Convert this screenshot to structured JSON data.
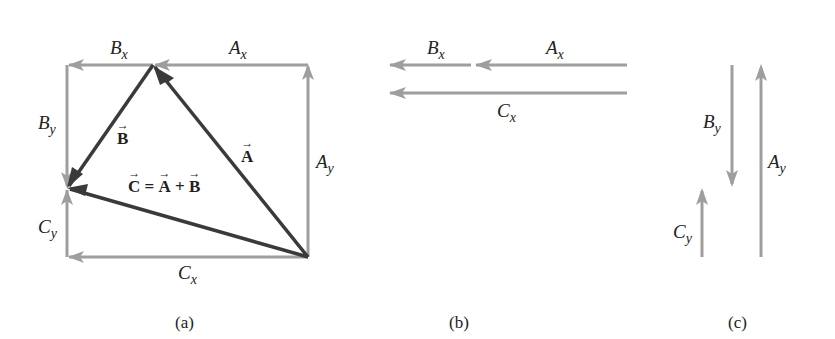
{
  "figure": {
    "colors": {
      "component": "#9e9e9e",
      "vector": "#3a3a3a",
      "text": "#222222"
    },
    "panels": {
      "a": {
        "caption": "(a)",
        "labels": {
          "Bx": {
            "base": "B",
            "sub": "x"
          },
          "Ax": {
            "base": "A",
            "sub": "x"
          },
          "By": {
            "base": "B",
            "sub": "y"
          },
          "Ay": {
            "base": "A",
            "sub": "y"
          },
          "Cy": {
            "base": "C",
            "sub": "y"
          },
          "Cx": {
            "base": "C",
            "sub": "x"
          },
          "vecB": "B",
          "vecA": "A",
          "sum": {
            "lhs": "C",
            "eq": "=",
            "a": "A",
            "plus": "+",
            "b": "B"
          }
        },
        "points": {
          "top_left": [
            67,
            65
          ],
          "top_vertex": [
            153,
            65
          ],
          "top_right": [
            308,
            65
          ],
          "bottom_right": [
            308,
            257
          ],
          "left_meet": [
            67,
            188
          ],
          "bottom_left": [
            67,
            257
          ]
        }
      },
      "b": {
        "caption": "(b)",
        "labels": {
          "Bx": {
            "base": "B",
            "sub": "x"
          },
          "Ax": {
            "base": "A",
            "sub": "x"
          },
          "Cx": {
            "base": "C",
            "sub": "x"
          }
        }
      },
      "c": {
        "caption": "(c)",
        "labels": {
          "By": {
            "base": "B",
            "sub": "y"
          },
          "Ay": {
            "base": "A",
            "sub": "y"
          },
          "Cy": {
            "base": "C",
            "sub": "y"
          }
        }
      }
    }
  }
}
